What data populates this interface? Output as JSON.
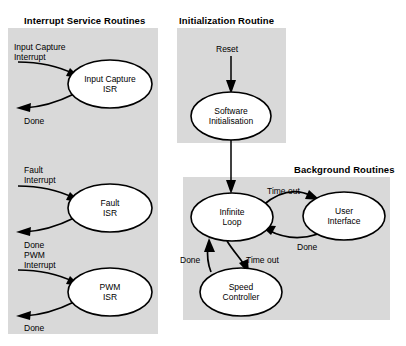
{
  "diagram": {
    "type": "state-flow-diagram",
    "background": "#ffffff",
    "panel_fill": "#d9d9d9",
    "stroke": "#000000",
    "panels": [
      {
        "id": "isr",
        "title": "Interrupt Service Routines",
        "x": 8,
        "y": 28,
        "w": 150,
        "h": 306
      },
      {
        "id": "init",
        "title": "Initialization Routine",
        "x": 177,
        "y": 28,
        "w": 109,
        "h": 115
      },
      {
        "id": "background",
        "title": "Background Routines",
        "x": 183,
        "y": 177,
        "w": 207,
        "h": 143
      }
    ],
    "nodes": [
      {
        "id": "input-capture-isr",
        "label": "Input Capture\nISR",
        "cx": 110,
        "cy": 84,
        "rx": 42,
        "ry": 24
      },
      {
        "id": "fault-isr",
        "label": "Fault\nISR",
        "cx": 110,
        "cy": 208,
        "rx": 42,
        "ry": 24
      },
      {
        "id": "pwm-isr",
        "label": "PWM\nISR",
        "cx": 110,
        "cy": 292,
        "rx": 42,
        "ry": 24
      },
      {
        "id": "software-initialisation",
        "label": "Software\nInitialisation",
        "cx": 231,
        "cy": 116,
        "rx": 40,
        "ry": 24
      },
      {
        "id": "infinite-loop",
        "label": "Infinite\nLoop",
        "cx": 232,
        "cy": 217,
        "rx": 41,
        "ry": 24
      },
      {
        "id": "user-interface",
        "label": "User\nInterface",
        "cx": 344,
        "cy": 216,
        "rx": 41,
        "ry": 24
      },
      {
        "id": "speed-controller",
        "label": "Speed\nController",
        "cx": 241,
        "cy": 292,
        "rx": 41,
        "ry": 24
      }
    ],
    "edge_labels": [
      {
        "id": "input-capture-interrupt",
        "text": "Input Capture\nInterrupt",
        "x": 14,
        "y": 42
      },
      {
        "id": "input-capture-done",
        "text": "Done",
        "x": 24,
        "y": 116
      },
      {
        "id": "fault-interrupt",
        "text": "Fault\nInterrupt",
        "x": 24,
        "y": 165
      },
      {
        "id": "fault-done",
        "text": "Done",
        "x": 24,
        "y": 240
      },
      {
        "id": "pwm-interrupt",
        "text": "PWM\nInterrupt",
        "x": 24,
        "y": 250
      },
      {
        "id": "pwm-done",
        "text": "Done",
        "x": 24,
        "y": 323
      },
      {
        "id": "reset",
        "text": "Reset",
        "x": 216,
        "y": 44
      },
      {
        "id": "ui-time-out",
        "text": "Time out",
        "x": 267,
        "y": 186
      },
      {
        "id": "ui-done",
        "text": "Done",
        "x": 297,
        "y": 242
      },
      {
        "id": "speed-done",
        "text": "Done",
        "x": 180,
        "y": 255
      },
      {
        "id": "speed-time-out",
        "text": "Time out",
        "x": 246,
        "y": 255
      }
    ]
  }
}
